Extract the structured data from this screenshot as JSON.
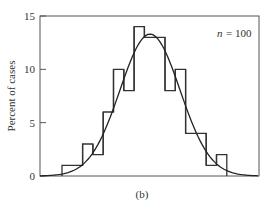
{
  "chart_data": {
    "type": "bar",
    "title": "",
    "caption": "(b)",
    "annotation": "n = 100",
    "xlabel": "",
    "ylabel": "Percent of cases",
    "ylim": [
      0,
      15
    ],
    "yticks": [
      0,
      5,
      10,
      15
    ],
    "bins": 16,
    "values": [
      1,
      1,
      3,
      2,
      6,
      10,
      8,
      14,
      13,
      13,
      8,
      10,
      4,
      4,
      1,
      2
    ],
    "overlay": {
      "type": "line",
      "name": "normal curve fit",
      "peak": 13.3
    },
    "grid": false,
    "legend": null
  },
  "labels": {
    "ylabel": "Percent of cases",
    "caption": "(b)",
    "annotation_n": "n",
    "annotation_eq": "= 100",
    "ticks": [
      "0",
      "5",
      "10",
      "15"
    ]
  }
}
